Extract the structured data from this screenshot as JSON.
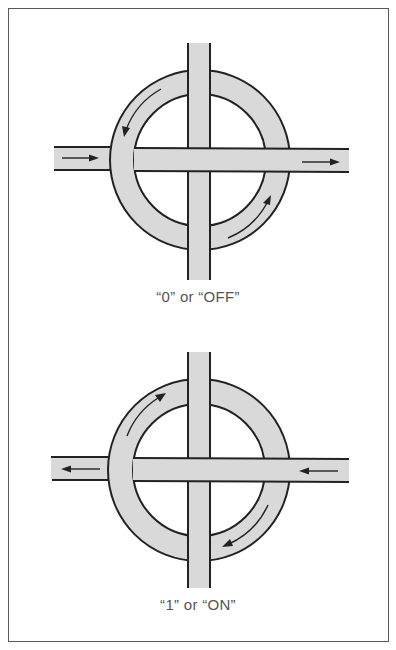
{
  "figure": {
    "colors": {
      "road_fill": "#d9d9d9",
      "outline": "#222222",
      "frame": "#5a5a5a",
      "caption_text": "#555555",
      "background": "#ffffff"
    },
    "panels": [
      {
        "id": "off",
        "caption": "“0” or “OFF”",
        "ring_direction": "counter-clockwise",
        "road_direction": "left-to-right",
        "center": [
          200,
          160
        ],
        "outer_radius": 90,
        "inner_radius": 66
      },
      {
        "id": "on",
        "caption": "“1” or “ON”",
        "ring_direction": "clockwise",
        "road_direction": "right-to-left",
        "center": [
          199,
          470
        ],
        "outer_radius": 92,
        "inner_radius": 68
      }
    ]
  }
}
